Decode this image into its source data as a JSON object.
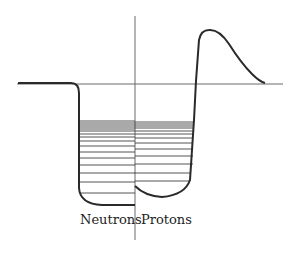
{
  "diagram": {
    "type": "nuclear-potential-well",
    "labels": {
      "left": "Neutrons",
      "right": "Protons"
    },
    "colors": {
      "stroke": "#2a2a2a",
      "axis": "#6a6a6a",
      "background": "#ffffff"
    },
    "neutron_levels_y": [
      121,
      123,
      125,
      127,
      129,
      131,
      134,
      137,
      141,
      146,
      152,
      158,
      165,
      173,
      182,
      193
    ],
    "proton_levels_y": [
      122,
      124,
      126,
      128,
      131,
      134,
      138,
      143,
      149,
      156,
      164,
      173,
      181
    ]
  }
}
